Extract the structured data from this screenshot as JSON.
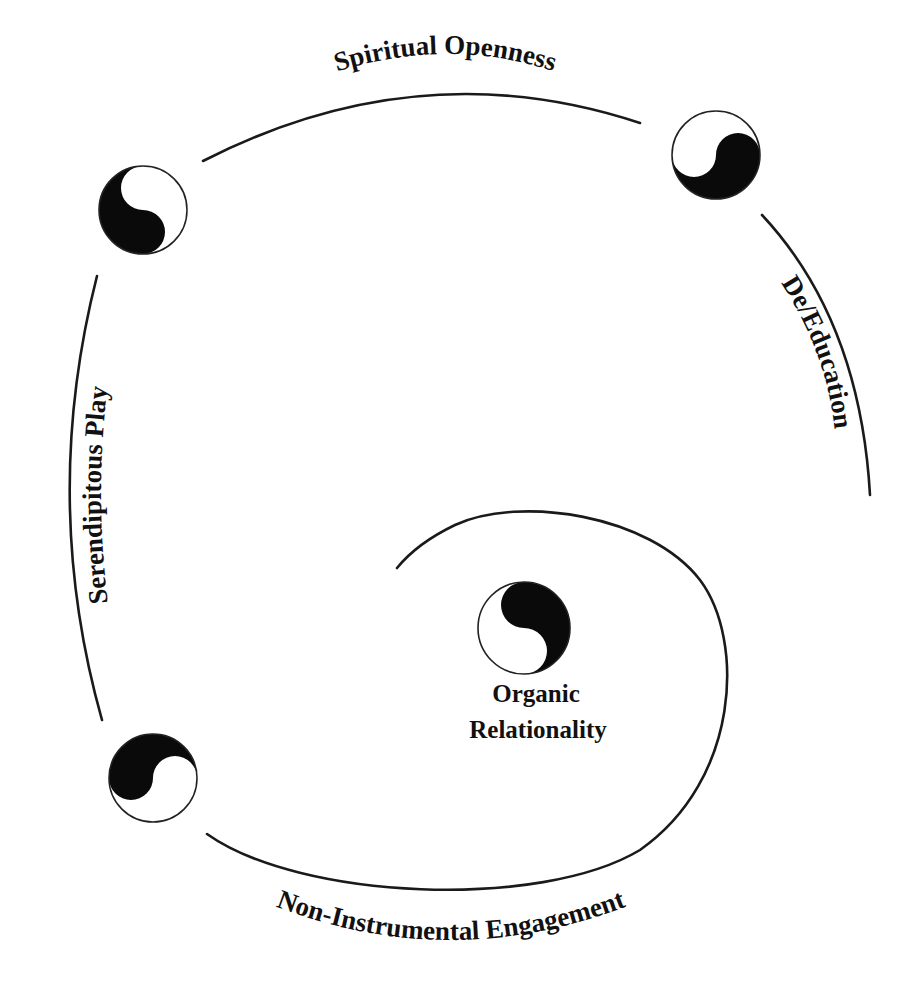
{
  "diagram": {
    "labels": {
      "spiritual_openness": "Spiritual Openness",
      "de_education": "De/Education",
      "serendipitous_play": "Serendipitous Play",
      "non_instrumental_engagement": "Non-Instrumental Engagement",
      "organic_line1": "Organic",
      "organic_line2": "Relationality"
    },
    "symbols": [
      {
        "name": "yin-yang-top-left",
        "cx": 143,
        "cy": 210,
        "r": 44,
        "rotation": 0
      },
      {
        "name": "yin-yang-top-right",
        "cx": 716,
        "cy": 155,
        "r": 44,
        "rotation": -90
      },
      {
        "name": "yin-yang-bottom-left",
        "cx": 153,
        "cy": 778,
        "r": 44,
        "rotation": 90
      },
      {
        "name": "yin-yang-center",
        "cx": 524,
        "cy": 628,
        "r": 46,
        "rotation": 180
      }
    ],
    "colors": {
      "ink": "#111111",
      "background": "#ffffff"
    }
  }
}
